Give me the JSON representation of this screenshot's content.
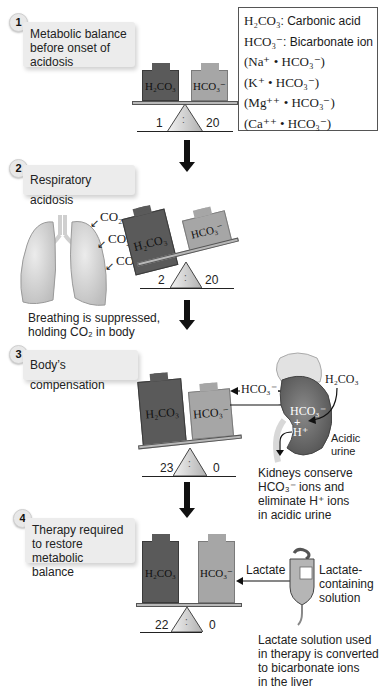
{
  "legend": {
    "rows": [
      {
        "formula": "H₂CO₃",
        "desc": ": Carbonic acid"
      },
      {
        "formula": "HCO₃⁻",
        "desc": ": Bicarbonate ion"
      },
      {
        "formula": "(Na⁺ • HCO₃⁻)",
        "desc": ""
      },
      {
        "formula": "(K⁺ • HCO₃⁻)",
        "desc": ""
      },
      {
        "formula": "(Mg⁺⁺ • HCO₃⁻)",
        "desc": ""
      },
      {
        "formula": "(Ca⁺⁺ • HCO₃⁻)",
        "desc": ""
      }
    ]
  },
  "steps": [
    {
      "number": "1",
      "title": "Metabolic balance before onset of acidosis",
      "left_weight": "H₂CO₃",
      "right_weight": "HCO₃⁻",
      "left_value": "1",
      "right_value": "20",
      "fulcrum_mark": ":"
    },
    {
      "number": "2",
      "title": "Respiratory acidosis",
      "left_weight": "H₂CO₃",
      "right_weight": "HCO₃⁻",
      "left_value": "2",
      "right_value": "20",
      "fulcrum_mark": ":",
      "co2_labels": [
        "CO₂",
        "CO₂",
        "CO₂"
      ],
      "caption_line1": "Breathing is suppressed,",
      "caption_line2": "holding CO₂ in body",
      "organ": "lungs"
    },
    {
      "number": "3",
      "title": "Body’s compensation",
      "left_weight": "H₂CO₃",
      "right_weight": "HCO₃⁻",
      "left_value": "23",
      "right_value": "0",
      "fulcrum_mark": ":",
      "organ": "kidney",
      "arrow_label": "HCO₃⁻",
      "kidney_input": "H₂CO₃",
      "kidney_hco3": "HCO₃⁻",
      "kidney_plus": "+",
      "kidney_h": "H⁺",
      "urine_label_1": "Acidic",
      "urine_label_2": "urine",
      "caption_lines": [
        "Kidneys conserve",
        "HCO₃⁻ ions and",
        "eliminate H⁺ ions",
        "in acidic urine"
      ]
    },
    {
      "number": "4",
      "title": "Therapy required to restore metabolic balance",
      "left_weight": "H₂CO₃",
      "right_weight": "HCO₃⁻",
      "left_value": "22",
      "right_value": "0",
      "fulcrum_mark": ":",
      "arrow_label": "Lactate",
      "iv_bag_label_lines": [
        "Lactate-",
        "containing",
        "solution"
      ],
      "caption_lines": [
        "Lactate solution used",
        "in therapy is converted",
        "to bicarbonate ions",
        "in the liver"
      ]
    }
  ],
  "colors": {
    "dark_weight": "#5a5a5a",
    "light_weight": "#a6a6a6",
    "step_box": "#ececec",
    "lung": "#d9d9d9",
    "kidney": "#6e6e6e"
  }
}
